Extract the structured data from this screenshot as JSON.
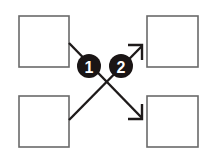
{
  "diagram": {
    "boxes": [
      {
        "id": "top-left",
        "label": ""
      },
      {
        "id": "top-right",
        "label": ""
      },
      {
        "id": "bottom-left",
        "label": ""
      },
      {
        "id": "bottom-right",
        "label": ""
      }
    ],
    "connections": [
      {
        "from": "top-left",
        "to": "bottom-right",
        "badge": "1"
      },
      {
        "from": "bottom-left",
        "to": "top-right",
        "badge": "2"
      }
    ],
    "colors": {
      "line": "#1e1a1a",
      "box_border": "#6a6a6a",
      "badge_fill": "#1a1515",
      "badge_text": "#ffffff"
    }
  }
}
